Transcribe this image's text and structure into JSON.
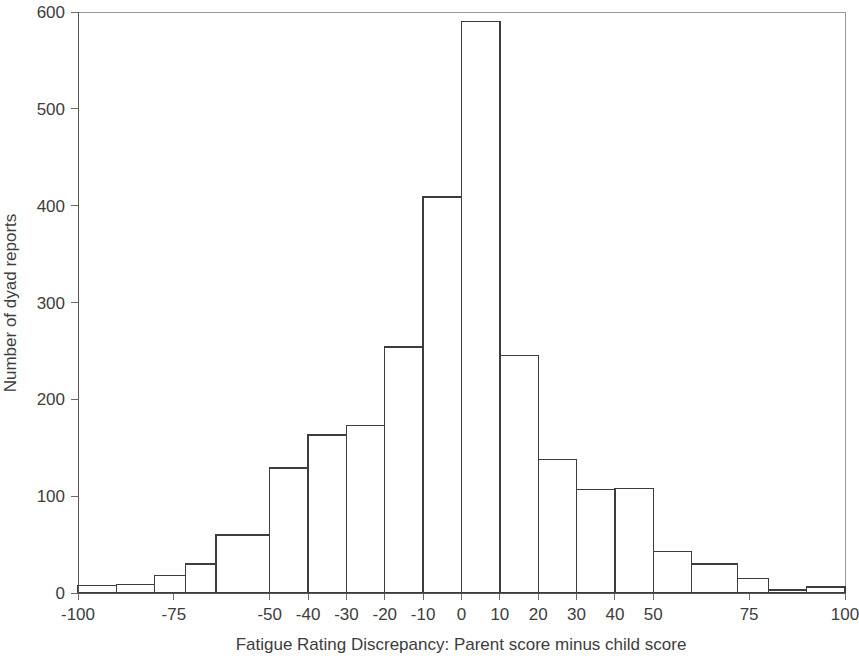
{
  "chart_data": {
    "type": "bar",
    "title": "",
    "subtitle": "",
    "xlabel": "Fatigue Rating Discrepancy: Parent score minus child score",
    "ylabel": "Number of dyad reports",
    "xlim": [
      -100,
      100
    ],
    "ylim": [
      0,
      600
    ],
    "grid": false,
    "legend": null,
    "annotations": [],
    "x_ticks": [
      {
        "value": -100,
        "label": "-100"
      },
      {
        "value": -75,
        "label": "-75"
      },
      {
        "value": -50,
        "label": "-50"
      },
      {
        "value": -40,
        "label": "-40"
      },
      {
        "value": -30,
        "label": "-30"
      },
      {
        "value": -20,
        "label": "-20"
      },
      {
        "value": -10,
        "label": "-10"
      },
      {
        "value": 0,
        "label": "0"
      },
      {
        "value": 10,
        "label": "10"
      },
      {
        "value": 20,
        "label": "20"
      },
      {
        "value": 30,
        "label": "30"
      },
      {
        "value": 40,
        "label": "40"
      },
      {
        "value": 50,
        "label": "50"
      },
      {
        "value": 75,
        "label": "75"
      },
      {
        "value": 100,
        "label": "100"
      }
    ],
    "y_ticks": [
      {
        "value": 0,
        "label": "0"
      },
      {
        "value": 100,
        "label": "100"
      },
      {
        "value": 200,
        "label": "200"
      },
      {
        "value": 300,
        "label": "300"
      },
      {
        "value": 400,
        "label": "400"
      },
      {
        "value": 500,
        "label": "500"
      },
      {
        "value": 600,
        "label": "600"
      }
    ],
    "bins": [
      {
        "x0": -100,
        "x1": -90,
        "count": 8
      },
      {
        "x0": -90,
        "x1": -80,
        "count": 9
      },
      {
        "x0": -80,
        "x1": -72,
        "count": 18
      },
      {
        "x0": -72,
        "x1": -64,
        "count": 30
      },
      {
        "x0": -64,
        "x1": -50,
        "count": 60
      },
      {
        "x0": -50,
        "x1": -40,
        "count": 129
      },
      {
        "x0": -40,
        "x1": -30,
        "count": 163
      },
      {
        "x0": -30,
        "x1": -20,
        "count": 173
      },
      {
        "x0": -20,
        "x1": -10,
        "count": 254
      },
      {
        "x0": -10,
        "x1": 0,
        "count": 409
      },
      {
        "x0": 0,
        "x1": 10,
        "count": 590
      },
      {
        "x0": 10,
        "x1": 20,
        "count": 245
      },
      {
        "x0": 20,
        "x1": 30,
        "count": 138
      },
      {
        "x0": 30,
        "x1": 40,
        "count": 107
      },
      {
        "x0": 40,
        "x1": 50,
        "count": 108
      },
      {
        "x0": 50,
        "x1": 60,
        "count": 43
      },
      {
        "x0": 60,
        "x1": 72,
        "count": 30
      },
      {
        "x0": 72,
        "x1": 80,
        "count": 15
      },
      {
        "x0": 80,
        "x1": 90,
        "count": 3
      },
      {
        "x0": 90,
        "x1": 100,
        "count": 6
      }
    ],
    "categories": [
      "-100 to -90",
      "-90 to -80",
      "-80 to -72",
      "-72 to -64",
      "-64 to -50",
      "-50 to -40",
      "-40 to -30",
      "-30 to -20",
      "-20 to -10",
      "-10 to 0",
      "0 to 10",
      "10 to 20",
      "20 to 30",
      "30 to 40",
      "40 to 50",
      "50 to 60",
      "60 to 72",
      "72 to 80",
      "80 to 90",
      "90 to 100"
    ],
    "values": [
      8,
      9,
      18,
      30,
      60,
      129,
      163,
      173,
      254,
      409,
      590,
      245,
      138,
      107,
      108,
      43,
      30,
      15,
      3,
      6
    ],
    "colors": {
      "bar_fill": "#ffffff",
      "bar_stroke": "#3d3d3d",
      "axis": "#555555",
      "frame": "#9a9a9a",
      "text": "#3d3d3d"
    }
  }
}
